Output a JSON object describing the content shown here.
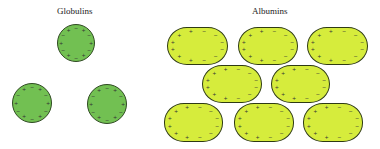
{
  "titles": {
    "globulins": "Globulins",
    "albumins": "Albumins"
  },
  "colors": {
    "globulin_fill": "#72c052",
    "globulin_border": "#2f4a22",
    "albumin_fill": "#d6ec3c",
    "albumin_border": "#2e3a14"
  },
  "globulins": [
    {
      "cx": 76,
      "cy": 43,
      "r": 19
    },
    {
      "cx": 32,
      "cy": 103,
      "r": 20
    },
    {
      "cx": 107,
      "cy": 104,
      "r": 20
    }
  ],
  "albumins": [
    {
      "x": 167,
      "y": 27,
      "w": 61,
      "h": 38
    },
    {
      "x": 238,
      "y": 27,
      "w": 60,
      "h": 38
    },
    {
      "x": 307,
      "y": 27,
      "w": 61,
      "h": 38
    },
    {
      "x": 202,
      "y": 65,
      "w": 60,
      "h": 38
    },
    {
      "x": 271,
      "y": 65,
      "w": 59,
      "h": 38
    },
    {
      "x": 164,
      "y": 103,
      "w": 59,
      "h": 39
    },
    {
      "x": 234,
      "y": 103,
      "w": 60,
      "h": 39
    },
    {
      "x": 303,
      "y": 103,
      "w": 60,
      "h": 39
    }
  ],
  "charge_marks": {
    "positive": "+",
    "negative": "−"
  }
}
